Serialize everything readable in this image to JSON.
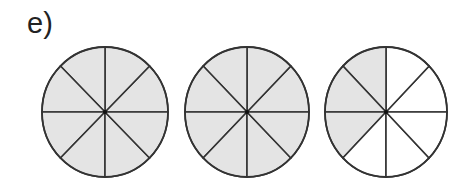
{
  "label": "e)",
  "colors": {
    "shaded": "#e4e4e4",
    "unshaded": "#ffffff",
    "stroke": "#333333"
  },
  "circles": [
    {
      "cx": 105,
      "cy": 112,
      "rx": 63,
      "ry": 65,
      "slices": 8,
      "shaded_slices": [
        0,
        1,
        2,
        3,
        4,
        5,
        6,
        7
      ]
    },
    {
      "cx": 247,
      "cy": 112,
      "rx": 62,
      "ry": 65,
      "slices": 8,
      "shaded_slices": [
        0,
        1,
        2,
        3,
        4,
        5,
        6,
        7
      ]
    },
    {
      "cx": 386,
      "cy": 112,
      "rx": 61,
      "ry": 65,
      "slices": 8,
      "shaded_slices": [
        2,
        3,
        4
      ]
    }
  ],
  "summary": {
    "shaded_total": 19,
    "slices_per_circle": 8
  }
}
